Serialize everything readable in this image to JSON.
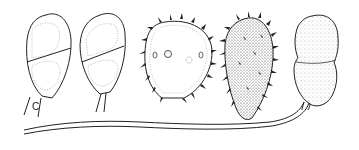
{
  "figure": {
    "type": "botanical line illustration of spores",
    "panels": [
      {
        "id": "spore-1",
        "description": "two-celled smooth ellipsoid spore with dotted inner outlines and short stalk"
      },
      {
        "id": "spore-2",
        "description": "two-celled smooth spore tilted, with slender stalk"
      },
      {
        "id": "spore-3",
        "description": "spiny outlined spore with pores"
      },
      {
        "id": "spore-4",
        "description": "densely stippled spiny spore"
      },
      {
        "id": "spore-5",
        "description": "stippled two-celled spore with long wavy stalk"
      }
    ],
    "labels": {
      "stalk_label": "C"
    },
    "colors": {
      "ink": "#222222",
      "background": "#ffffff"
    }
  }
}
